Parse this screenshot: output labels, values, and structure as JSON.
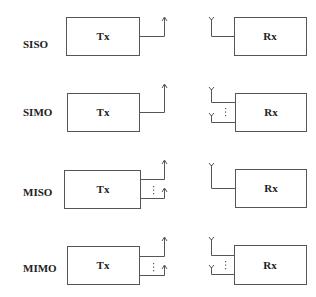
{
  "diagram": {
    "colors": {
      "stroke": "#555555",
      "text": "#222222",
      "background": "#ffffff"
    },
    "rows": [
      {
        "label": "SISO",
        "tx_label": "Tx",
        "rx_label": "Rx",
        "tx_antennas": 1,
        "rx_antennas": 1
      },
      {
        "label": "SIMO",
        "tx_label": "Tx",
        "rx_label": "Rx",
        "tx_antennas": 1,
        "rx_antennas": "multiple"
      },
      {
        "label": "MISO",
        "tx_label": "Tx",
        "rx_label": "Rx",
        "tx_antennas": "multiple",
        "rx_antennas": 1
      },
      {
        "label": "MIMO",
        "tx_label": "Tx",
        "rx_label": "Rx",
        "tx_antennas": "multiple",
        "rx_antennas": "multiple"
      }
    ],
    "icons": {
      "tx_antenna": "arrow-up-antenna-icon",
      "rx_antenna": "y-fork-antenna-icon",
      "ellipsis": "vertical-ellipsis-icon"
    }
  }
}
